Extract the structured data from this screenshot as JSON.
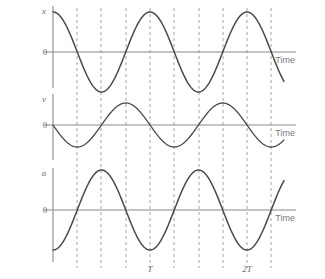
{
  "figure": {
    "background_color": "#ffffff",
    "curve_color": "#4a4a4a",
    "axis_color": "#8a8a8a",
    "dash_color": "#9a9a9a",
    "text_color": "#6e6e6e"
  },
  "panels": [
    {
      "key": "displacement",
      "vertical_axis_label": "x",
      "zero_label": "0",
      "time_label": "Time",
      "baseline_y": 52,
      "amplitude": 40,
      "phase": "cosine",
      "axis_top": 6,
      "axis_bottom": 88
    },
    {
      "key": "velocity",
      "vertical_axis_label": "v",
      "zero_label": "0",
      "time_label": "Time",
      "baseline_y": 125,
      "amplitude": 22,
      "phase": "negative-sine",
      "axis_top": 94,
      "axis_bottom": 160
    },
    {
      "key": "acceleration",
      "vertical_axis_label": "a",
      "zero_label": "0",
      "time_label": "Time",
      "baseline_y": 210,
      "amplitude": 40,
      "phase": "negative-cosine",
      "axis_top": 168,
      "axis_bottom": 262
    }
  ],
  "time_axis": {
    "origin_x": 53,
    "end_x": 296,
    "curve_end_x": 284,
    "period_px": 97,
    "quarter_px": 24.25,
    "dashed_positions": [
      53,
      77,
      101,
      126,
      150,
      174,
      199,
      223,
      247,
      271
    ],
    "markers": [
      {
        "label": "T",
        "x": 150
      },
      {
        "label": "2T",
        "x": 247
      }
    ]
  },
  "chart_data": {
    "type": "line",
    "title": "",
    "xlabel": "Time",
    "ylabel": "",
    "grid": false,
    "legend": "none",
    "x_tick_labels": [
      "T",
      "2T"
    ],
    "x_tick_values": [
      1,
      2
    ],
    "xlim": [
      0,
      2.5
    ],
    "series": [
      {
        "name": "x",
        "ylabel": "x",
        "function": "A*cos(2*pi*t/T)",
        "amplitude": 1,
        "phase_deg": 0,
        "ylim": [
          -1.2,
          1.2
        ],
        "x": [
          0,
          0.25,
          0.5,
          0.75,
          1,
          1.25,
          1.5,
          1.75,
          2,
          2.25,
          2.38
        ],
        "values": [
          1,
          0,
          -1,
          0,
          1,
          0,
          -1,
          0,
          1,
          0,
          -0.37
        ]
      },
      {
        "name": "v",
        "ylabel": "v",
        "function": "-A*sin(2*pi*t/T)",
        "amplitude": 1,
        "phase_deg": 180,
        "ylim": [
          -1.2,
          1.2
        ],
        "x": [
          0,
          0.25,
          0.5,
          0.75,
          1,
          1.25,
          1.5,
          1.75,
          2,
          2.25,
          2.38
        ],
        "values": [
          0,
          -1,
          0,
          1,
          0,
          -1,
          0,
          1,
          0,
          -1,
          -0.93
        ]
      },
      {
        "name": "a",
        "ylabel": "a",
        "function": "-A*cos(2*pi*t/T)",
        "amplitude": 1,
        "phase_deg": 180,
        "ylim": [
          -1.2,
          1.2
        ],
        "x": [
          0,
          0.25,
          0.5,
          0.75,
          1,
          1.25,
          1.5,
          1.75,
          2,
          2.25,
          2.38
        ],
        "values": [
          -1,
          0,
          1,
          0,
          -1,
          0,
          1,
          0,
          -1,
          0,
          0.37
        ]
      }
    ]
  }
}
